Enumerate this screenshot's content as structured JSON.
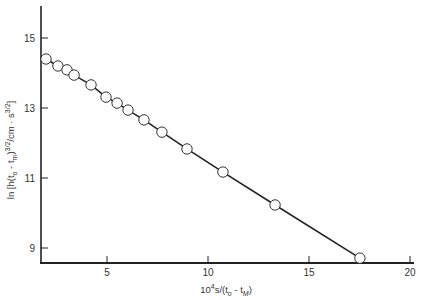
{
  "chart_data": {
    "type": "scatter",
    "title": "",
    "xlabel": "10^4 s/(t_o - t_M)",
    "ylabel": "ln [h(t_o - t_m)^{3/2}/cm · s^{3/2}]",
    "xlabel_parts": {
      "base": "10",
      "sup": "4",
      "rest": "s/(t",
      "sub1": "o",
      "mid": " - t",
      "sub2": "M",
      "close": ")"
    },
    "ylabel_parts": {
      "a": "ln [h(t",
      "sub1": "o",
      "b": " - t",
      "sub2": "m",
      "c": ")",
      "sup1": "3/2",
      "d": "/cm · s",
      "sup2": "3/2",
      "e": "]"
    },
    "xlim": [
      1.6,
      20.5
    ],
    "ylim": [
      8.6,
      15.8
    ],
    "xticks": [
      5,
      10,
      15,
      20
    ],
    "yticks": [
      9,
      11,
      13,
      15
    ],
    "grid": false,
    "legend": null,
    "marker": "open-circle",
    "fit_line": true,
    "series": [
      {
        "name": "data",
        "x": [
          1.98,
          2.57,
          3.02,
          3.37,
          4.21,
          4.95,
          5.5,
          6.04,
          6.83,
          7.72,
          8.96,
          10.74,
          13.32,
          17.52
        ],
        "y": [
          14.4,
          14.2,
          14.09,
          13.94,
          13.66,
          13.31,
          13.14,
          12.94,
          12.66,
          12.31,
          11.83,
          11.17,
          10.23,
          8.71
        ]
      }
    ]
  }
}
